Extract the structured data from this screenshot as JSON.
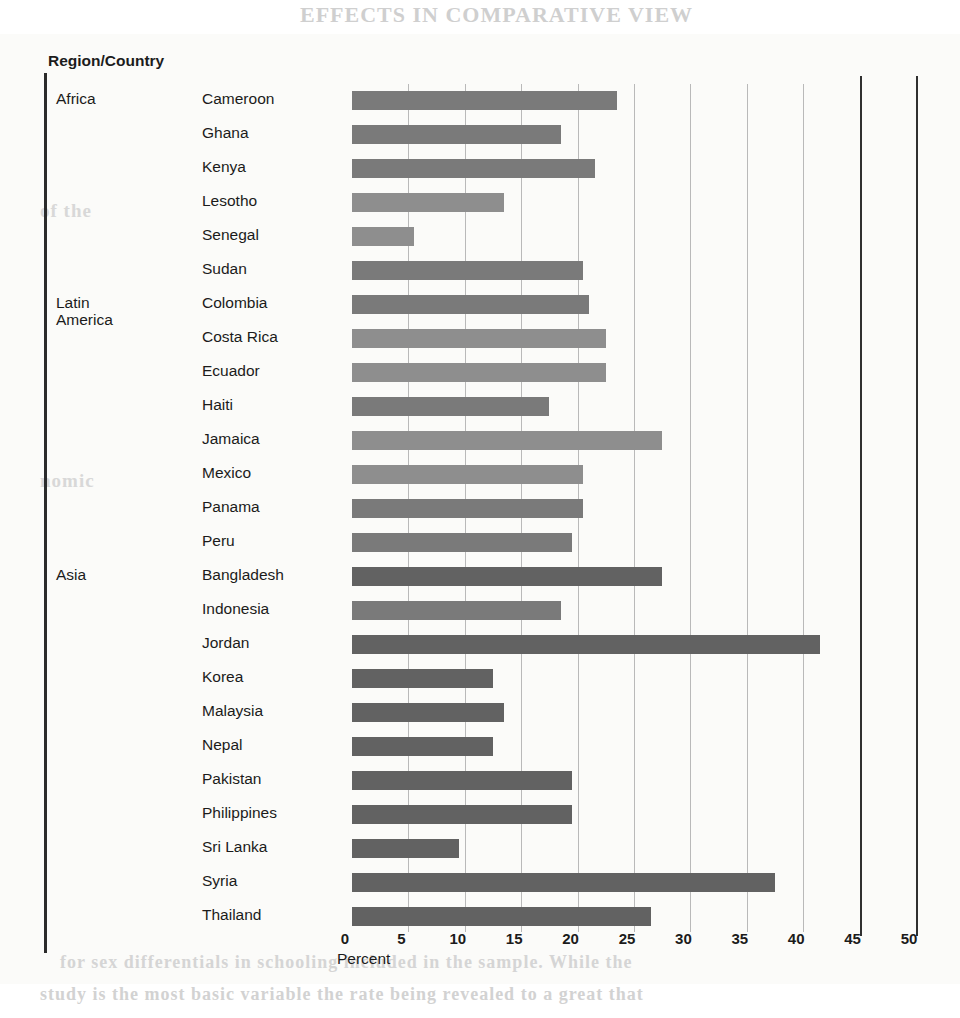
{
  "page": {
    "ghost_text": {
      "header": "EFFECTS IN COMPARATIVE VIEW",
      "line1": "of the",
      "line2": "nomic",
      "line3": "and is not",
      "line4": "for sex differentials in schooling included in the sample. While the",
      "line5": "study is the most basic variable the rate being revealed to a great that"
    }
  },
  "chart_header": {
    "column_title": "Region/Country",
    "axis_title": "Percent"
  },
  "chart_data": {
    "type": "bar",
    "orientation": "horizontal",
    "title": "",
    "xlabel": "Percent",
    "ylabel": "Region/Country",
    "xlim": [
      0,
      50
    ],
    "xticks": [
      0,
      5,
      10,
      15,
      20,
      25,
      30,
      35,
      40,
      45,
      50
    ],
    "grid": true,
    "legend": "none",
    "groups": [
      "Africa",
      "Latin America",
      "Asia"
    ],
    "categories": [
      "Cameroon",
      "Ghana",
      "Kenya",
      "Lesotho",
      "Senegal",
      "Sudan",
      "Colombia",
      "Costa Rica",
      "Ecuador",
      "Haiti",
      "Jamaica",
      "Mexico",
      "Panama",
      "Peru",
      "Bangladesh",
      "Indonesia",
      "Jordan",
      "Korea",
      "Malaysia",
      "Nepal",
      "Pakistan",
      "Philippines",
      "Sri Lanka",
      "Syria",
      "Thailand"
    ],
    "values": [
      23.5,
      18.5,
      21.5,
      13.5,
      5.5,
      20.5,
      21.0,
      22.5,
      22.5,
      17.5,
      27.5,
      20.5,
      20.5,
      19.5,
      27.5,
      18.5,
      41.5,
      12.5,
      13.5,
      12.5,
      19.5,
      19.5,
      9.5,
      37.5,
      26.5
    ]
  },
  "rows": [
    {
      "region": "Africa",
      "region2": "",
      "country": "Cameroon",
      "value": 23.5,
      "shade": "mid"
    },
    {
      "region": "",
      "region2": "",
      "country": "Ghana",
      "value": 18.5,
      "shade": "mid"
    },
    {
      "region": "",
      "region2": "",
      "country": "Kenya",
      "value": 21.5,
      "shade": "mid"
    },
    {
      "region": "",
      "region2": "",
      "country": "Lesotho",
      "value": 13.5,
      "shade": "light"
    },
    {
      "region": "",
      "region2": "",
      "country": "Senegal",
      "value": 5.5,
      "shade": "light"
    },
    {
      "region": "",
      "region2": "",
      "country": "Sudan",
      "value": 20.5,
      "shade": "mid"
    },
    {
      "region": "Latin",
      "region2": "America",
      "country": "Colombia",
      "value": 21.0,
      "shade": "mid"
    },
    {
      "region": "",
      "region2": "",
      "country": "Costa Rica",
      "value": 22.5,
      "shade": "light"
    },
    {
      "region": "",
      "region2": "",
      "country": "Ecuador",
      "value": 22.5,
      "shade": "light"
    },
    {
      "region": "",
      "region2": "",
      "country": "Haiti",
      "value": 17.5,
      "shade": "mid"
    },
    {
      "region": "",
      "region2": "",
      "country": "Jamaica",
      "value": 27.5,
      "shade": "light"
    },
    {
      "region": "",
      "region2": "",
      "country": "Mexico",
      "value": 20.5,
      "shade": "light"
    },
    {
      "region": "",
      "region2": "",
      "country": "Panama",
      "value": 20.5,
      "shade": "mid"
    },
    {
      "region": "",
      "region2": "",
      "country": "Peru",
      "value": 19.5,
      "shade": "mid"
    },
    {
      "region": "Asia",
      "region2": "",
      "country": "Bangladesh",
      "value": 27.5,
      "shade": "dark"
    },
    {
      "region": "",
      "region2": "",
      "country": "Indonesia",
      "value": 18.5,
      "shade": "mid"
    },
    {
      "region": "",
      "region2": "",
      "country": "Jordan",
      "value": 41.5,
      "shade": "dark"
    },
    {
      "region": "",
      "region2": "",
      "country": "Korea",
      "value": 12.5,
      "shade": "dark"
    },
    {
      "region": "",
      "region2": "",
      "country": "Malaysia",
      "value": 13.5,
      "shade": "dark"
    },
    {
      "region": "",
      "region2": "",
      "country": "Nepal",
      "value": 12.5,
      "shade": "dark"
    },
    {
      "region": "",
      "region2": "",
      "country": "Pakistan",
      "value": 19.5,
      "shade": "dark"
    },
    {
      "region": "",
      "region2": "",
      "country": "Philippines",
      "value": 19.5,
      "shade": "dark"
    },
    {
      "region": "",
      "region2": "",
      "country": "Sri Lanka",
      "value": 9.5,
      "shade": "dark"
    },
    {
      "region": "",
      "region2": "",
      "country": "Syria",
      "value": 37.5,
      "shade": "dark"
    },
    {
      "region": "",
      "region2": "",
      "country": "Thailand",
      "value": 26.5,
      "shade": "dark"
    }
  ],
  "geometry": {
    "x0_px": 352,
    "px_per_unit": 11.28,
    "row_top_px": 84,
    "row_height_px": 34
  },
  "colors": {
    "bar_light": "#8e8e8e",
    "bar_mid": "#7a7a7a",
    "bar_dark": "#626262",
    "axis": "#2b2b2b",
    "grid": "#b9b9b9",
    "text": "#1b1b1b"
  }
}
